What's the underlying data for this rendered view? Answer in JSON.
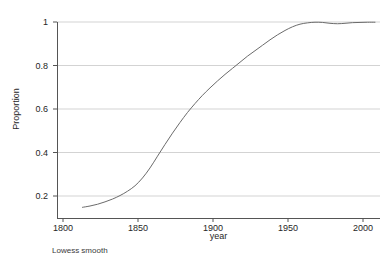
{
  "figure": {
    "caption": "Lowess smooth",
    "background_color": "#ffffff"
  },
  "axes": {
    "x_title": "year",
    "y_title": "Proportion",
    "x_ticks": [
      "1800",
      "1850",
      "1900",
      "1950",
      "2000"
    ],
    "y_ticks": [
      "1",
      "0.8",
      "0.6",
      "0.4",
      "0.2"
    ],
    "axis_color": "#555555",
    "grid_color": "#c8c8c8"
  },
  "chart_data": {
    "type": "line",
    "title": "",
    "subtitle": "",
    "xlabel": "year",
    "ylabel": "Proportion",
    "annotations": [
      "Lowess smooth"
    ],
    "legend": [],
    "legend_position": "none",
    "grid": "horizontal",
    "xlim": [
      1780,
      2015
    ],
    "ylim": [
      0.13,
      1.02
    ],
    "xticks": [
      1800,
      1850,
      1900,
      1950,
      2000
    ],
    "yticks": [
      0.2,
      0.4,
      0.6,
      0.8,
      1.0
    ],
    "line_color": "#6b6b6b",
    "line_width": 1,
    "series": [
      {
        "name": "Lowess smooth",
        "x": [
          1813,
          1818,
          1823,
          1828,
          1833,
          1838,
          1843,
          1848,
          1853,
          1858,
          1863,
          1868,
          1873,
          1878,
          1883,
          1888,
          1893,
          1898,
          1903,
          1908,
          1913,
          1918,
          1923,
          1928,
          1933,
          1938,
          1943,
          1948,
          1953,
          1958,
          1963,
          1968,
          1973,
          1978,
          1983,
          1988,
          1993,
          1998,
          2003,
          2008
        ],
        "y": [
          0.148,
          0.154,
          0.162,
          0.173,
          0.186,
          0.202,
          0.222,
          0.247,
          0.283,
          0.329,
          0.383,
          0.437,
          0.489,
          0.538,
          0.584,
          0.625,
          0.663,
          0.697,
          0.729,
          0.759,
          0.787,
          0.815,
          0.843,
          0.868,
          0.893,
          0.918,
          0.941,
          0.961,
          0.978,
          0.99,
          0.996,
          0.999,
          0.998,
          0.994,
          0.992,
          0.994,
          0.997,
          0.998,
          0.999,
          0.999
        ]
      }
    ]
  }
}
